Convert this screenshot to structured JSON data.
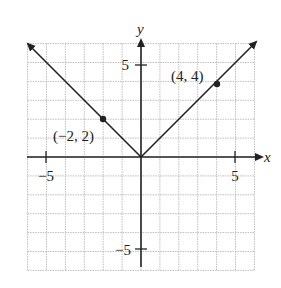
{
  "chart_data": {
    "type": "line",
    "title": "",
    "xlabel": "x",
    "ylabel": "y",
    "xlim": [
      -6,
      6
    ],
    "ylim": [
      -6,
      6
    ],
    "grid": true,
    "x_ticks_labeled": [
      -5,
      5
    ],
    "y_ticks_labeled": [
      5,
      -5
    ],
    "tick_labels": {
      "x_neg": "−5",
      "x_pos": "5",
      "y_pos": "5",
      "y_neg": "−5"
    },
    "series": [
      {
        "name": "y = |x|",
        "x": [
          -6.9,
          -2,
          0,
          4,
          6.9
        ],
        "y": [
          6.9,
          2,
          0,
          4,
          6.9
        ],
        "arrows_at_ends": true
      }
    ],
    "annotations": [
      {
        "text": "(−2, 2)",
        "point": [
          -2,
          2
        ]
      },
      {
        "text": "(4, 4)",
        "point": [
          4,
          4
        ]
      }
    ]
  },
  "axis_labels": {
    "x": "x",
    "y": "y"
  },
  "points": [
    {
      "label": "(−2, 2)"
    },
    {
      "label": "(4, 4)"
    }
  ]
}
